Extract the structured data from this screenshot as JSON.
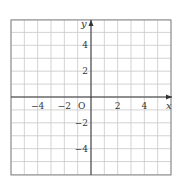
{
  "diagram": {
    "type": "coordinate-grid",
    "x_range": [
      -6,
      6
    ],
    "y_range": [
      -6,
      6
    ],
    "grid_step": 1,
    "axis_labels": {
      "x": "x",
      "y": "y",
      "origin": "O"
    },
    "x_ticks": [
      {
        "value": -4,
        "label": "−4"
      },
      {
        "value": -2,
        "label": "−2"
      },
      {
        "value": 2,
        "label": "2"
      },
      {
        "value": 4,
        "label": "4"
      }
    ],
    "y_ticks": [
      {
        "value": 4,
        "label": "4"
      },
      {
        "value": 2,
        "label": "2"
      },
      {
        "value": -2,
        "label": "−2"
      },
      {
        "value": -4,
        "label": "−4"
      }
    ],
    "colors": {
      "grid": "#c8c8c8",
      "axis": "#333333",
      "border": "#888888"
    }
  }
}
